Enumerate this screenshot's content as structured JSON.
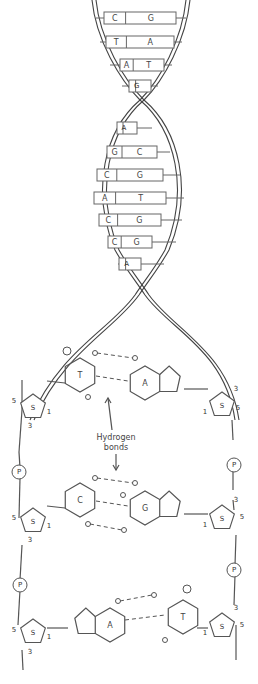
{
  "diagram": {
    "helix_pairs": [
      {
        "y": 18,
        "left": "C",
        "right": "G",
        "x": 140,
        "w": 72
      },
      {
        "y": 42,
        "left": "T",
        "right": "A",
        "x": 140,
        "w": 68
      },
      {
        "y": 65,
        "left": "A",
        "right": "T",
        "x": 142,
        "w": 44
      },
      {
        "y": 86,
        "left": "G",
        "right": "C",
        "x": 140,
        "w": 22
      },
      {
        "y": 128,
        "left": "A",
        "right": "T",
        "x": 127,
        "w": 20
      },
      {
        "y": 152,
        "left": "G",
        "right": "C",
        "x": 132,
        "w": 50
      },
      {
        "y": 175,
        "left": "C",
        "right": "G",
        "x": 130,
        "w": 66
      },
      {
        "y": 198,
        "left": "A",
        "right": "T",
        "x": 130,
        "w": 72
      },
      {
        "y": 220,
        "left": "C",
        "right": "G",
        "x": 130,
        "w": 62
      },
      {
        "y": 242,
        "left": "C",
        "right": "G",
        "x": 130,
        "w": 44
      },
      {
        "y": 264,
        "left": "A",
        "right": "T",
        "x": 130,
        "w": 22
      }
    ],
    "backbone": {
      "sugar_label": "S",
      "phosphate_label": "P",
      "carbon_labels": {
        "five": "5",
        "three": "3",
        "one": "1"
      }
    },
    "base_pairs_detail": [
      {
        "left": "T",
        "right": "A",
        "y": 375
      },
      {
        "left": "C",
        "right": "G",
        "y": 500
      },
      {
        "left": "A",
        "right": "T",
        "y": 625
      }
    ],
    "annotation": {
      "line1": "Hydrogen",
      "line2": "bonds"
    }
  }
}
